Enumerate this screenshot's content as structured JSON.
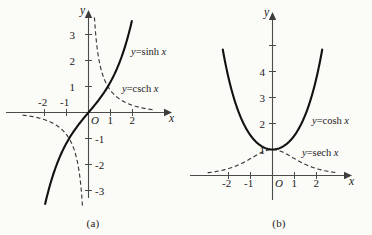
{
  "figure": {
    "background_color": "#fbfbf8",
    "curve_color": "#121212",
    "dashed_color": "#3a3a3a",
    "axis_color": "#4b4b4b"
  },
  "panels": [
    {
      "id": "a",
      "caption": "(a)",
      "x_axis_label": "x",
      "y_axis_label": "y",
      "origin_label": "O",
      "x_ticks": [
        {
          "value": -2,
          "label": "-2"
        },
        {
          "value": -1,
          "label": "-1"
        },
        {
          "value": 1,
          "label": "1"
        },
        {
          "value": 2,
          "label": "2"
        }
      ],
      "y_ticks": [
        {
          "value": 3,
          "label": "3"
        },
        {
          "value": 2,
          "label": "2"
        },
        {
          "value": 1,
          "label": "1"
        },
        {
          "value": -1,
          "label": "-1"
        },
        {
          "value": -2,
          "label": "-2"
        },
        {
          "value": -3,
          "label": "-3"
        }
      ],
      "curve_labels": [
        {
          "id": "sinh",
          "prefix": "y",
          "eq": "=",
          "name": "sinh",
          "arg": "x",
          "text": "y=sinh x"
        },
        {
          "id": "csch",
          "prefix": "y",
          "eq": "=",
          "name": "csch",
          "arg": "x",
          "text": "y=csch x"
        }
      ]
    },
    {
      "id": "b",
      "caption": "(b)",
      "x_axis_label": "x",
      "y_axis_label": "y",
      "origin_label": "O",
      "x_ticks": [
        {
          "value": -2,
          "label": "-2"
        },
        {
          "value": -1,
          "label": "-1"
        },
        {
          "value": 1,
          "label": "1"
        },
        {
          "value": 2,
          "label": "2"
        }
      ],
      "y_ticks": [
        {
          "value": 5,
          "label": ""
        },
        {
          "value": 4,
          "label": "4"
        },
        {
          "value": 3,
          "label": "3"
        },
        {
          "value": 2,
          "label": "2"
        },
        {
          "value": 1,
          "label": "1"
        }
      ],
      "curve_labels": [
        {
          "id": "cosh",
          "prefix": "y",
          "eq": "=",
          "name": "cosh",
          "arg": "x",
          "text": "y=cosh x"
        },
        {
          "id": "sech",
          "prefix": "y",
          "eq": "=",
          "name": "sech",
          "arg": "x",
          "text": "y=sech x"
        }
      ]
    }
  ],
  "chart_data": [
    {
      "type": "line",
      "panel": "a",
      "title": "",
      "xlabel": "x",
      "ylabel": "y",
      "xlim": [
        -2.6,
        2.8
      ],
      "ylim": [
        -3.6,
        3.7
      ],
      "grid": false,
      "legend": "inline-curve-labels",
      "xticks": [
        -2,
        -1,
        1,
        2
      ],
      "yticks": [
        -3,
        -2,
        -1,
        1,
        2,
        3
      ],
      "series": [
        {
          "name": "y=sinh x",
          "style": "solid",
          "x": [
            -1.95,
            -1.75,
            -1.5,
            -1.25,
            -1.0,
            -0.75,
            -0.5,
            -0.25,
            0,
            0.25,
            0.5,
            0.75,
            1.0,
            1.25,
            1.5,
            1.75,
            1.95
          ],
          "y": [
            -3.44,
            -2.79,
            -2.13,
            -1.6,
            -1.18,
            -0.82,
            -0.52,
            -0.25,
            0,
            0.25,
            0.52,
            0.82,
            1.18,
            1.6,
            2.13,
            2.79,
            3.44
          ]
        },
        {
          "name": "y=csch x",
          "style": "dashed",
          "x": [
            -2.6,
            -2.2,
            -1.8,
            -1.4,
            -1.0,
            -0.7,
            -0.5,
            -0.35,
            -0.28,
            0.28,
            0.35,
            0.5,
            0.7,
            1.0,
            1.4,
            1.8,
            2.2,
            2.6
          ],
          "y": [
            -0.15,
            -0.22,
            -0.33,
            -0.52,
            -0.85,
            -1.32,
            -1.92,
            -2.82,
            -3.55,
            3.55,
            2.82,
            1.92,
            1.32,
            0.85,
            0.52,
            0.33,
            0.22,
            0.15
          ]
        }
      ]
    },
    {
      "type": "line",
      "panel": "b",
      "title": "",
      "xlabel": "x",
      "ylabel": "y",
      "xlim": [
        -2.7,
        2.8
      ],
      "ylim": [
        -0.6,
        5.4
      ],
      "grid": false,
      "legend": "inline-curve-labels",
      "xticks": [
        -2,
        -1,
        1,
        2
      ],
      "yticks": [
        1,
        2,
        3,
        4,
        5
      ],
      "series": [
        {
          "name": "y=cosh x",
          "style": "solid",
          "x": [
            -2.26,
            -2.0,
            -1.75,
            -1.5,
            -1.25,
            -1.0,
            -0.75,
            -0.5,
            -0.25,
            0,
            0.25,
            0.5,
            0.75,
            1.0,
            1.25,
            1.5,
            1.75,
            2.0,
            2.26
          ],
          "y": [
            4.82,
            3.76,
            2.98,
            2.35,
            1.89,
            1.54,
            1.29,
            1.13,
            1.03,
            1.0,
            1.03,
            1.13,
            1.29,
            1.54,
            1.89,
            2.35,
            2.98,
            3.76,
            4.82
          ]
        },
        {
          "name": "y=sech x",
          "style": "dashed",
          "x": [
            -2.7,
            -2.4,
            -2.0,
            -1.6,
            -1.2,
            -0.8,
            -0.4,
            0,
            0.4,
            0.8,
            1.2,
            1.6,
            2.0,
            2.4,
            2.7
          ],
          "y": [
            0.13,
            0.18,
            0.27,
            0.39,
            0.55,
            0.75,
            0.92,
            1.0,
            0.92,
            0.75,
            0.55,
            0.39,
            0.27,
            0.18,
            0.13
          ]
        }
      ]
    }
  ]
}
